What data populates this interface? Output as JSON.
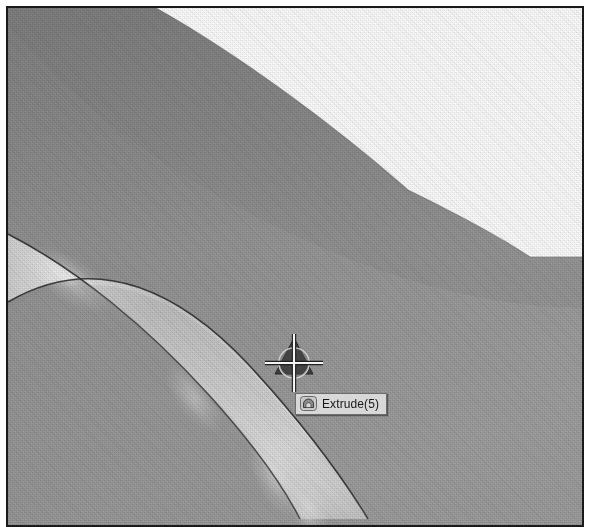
{
  "application": {
    "type": "cad-3d-viewport",
    "view_mode": "Shaded with Edges"
  },
  "viewport": {
    "name": "graphics-area",
    "background_color": "#fdfdfd",
    "frame_border_color": "#1a1a1a",
    "page_background_color": "#ffffff"
  },
  "geometry": {
    "body_fill_top": "#8e8e8e",
    "body_fill_bottom": "#9b9b9b",
    "band_highlight_color": "#e6e6e6",
    "edge_line_color": "#2b2b2b",
    "faces": [
      {
        "id": "outer-revolved-face",
        "label": "outer revolved face",
        "shade": "#8f8f8f"
      },
      {
        "id": "fillet-band-face",
        "label": "fillet band face",
        "shade": "#d2d2d2"
      },
      {
        "id": "inner-face",
        "label": "inner face",
        "shade": "#9a9a9a"
      }
    ],
    "edges": [
      {
        "id": "silhouette-arc",
        "label": "outer silhouette arc"
      },
      {
        "id": "band-upper-edge",
        "label": "band upper edge"
      },
      {
        "id": "band-lower-edge",
        "label": "band lower edge"
      }
    ]
  },
  "cursor": {
    "name": "select-cursor",
    "icon": "crosshair-with-feature-triad",
    "x": 286,
    "y": 354,
    "crosshair_color": "#f2f2f2",
    "glyph_color": "#3a3a3a"
  },
  "tooltip": {
    "name": "feature-tooltip",
    "icon": "extrude-feature-icon",
    "label": "Extrude(5)",
    "background_color": "#d8d8d8",
    "border_color": "#6d6d6d",
    "text_color": "#171717"
  }
}
